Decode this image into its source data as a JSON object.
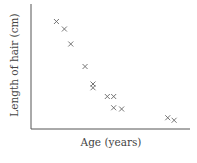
{
  "chart_data": {
    "type": "scatter",
    "title": "",
    "xlabel": "Age (years)",
    "ylabel": "Length of hair (cm)",
    "xlim": [
      0,
      100
    ],
    "ylim": [
      0,
      100
    ],
    "grid": false,
    "legend": null,
    "marker": "x",
    "axis_ticks": false,
    "points": [
      {
        "x": 16,
        "y": 86
      },
      {
        "x": 21,
        "y": 80
      },
      {
        "x": 25,
        "y": 68
      },
      {
        "x": 34,
        "y": 50
      },
      {
        "x": 39,
        "y": 36
      },
      {
        "x": 39,
        "y": 33
      },
      {
        "x": 48,
        "y": 26
      },
      {
        "x": 52,
        "y": 26
      },
      {
        "x": 52,
        "y": 17
      },
      {
        "x": 57,
        "y": 16
      },
      {
        "x": 86,
        "y": 9
      },
      {
        "x": 90,
        "y": 7
      }
    ]
  },
  "colors": {
    "axis": "#555555",
    "marker": "#666666",
    "text": "#444444"
  }
}
